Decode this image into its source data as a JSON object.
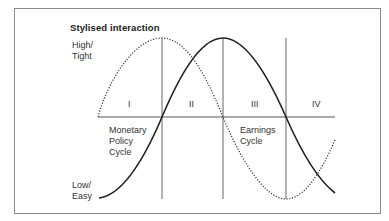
{
  "title": "Stylised interaction",
  "y_axis": {
    "top_label_line1": "High/",
    "top_label_line2": "Tight",
    "bottom_label_line1": "Low/",
    "bottom_label_line2": "Easy"
  },
  "phases": [
    "I",
    "II",
    "III",
    "IV"
  ],
  "curves": {
    "monetary": {
      "line1": "Monetary",
      "line2": "Policy",
      "line3": "Cycle",
      "style": "solid"
    },
    "earnings": {
      "line1": "Earnings",
      "line2": "Cycle",
      "style": "dotted"
    }
  },
  "colors": {
    "line": "#222222",
    "frame": "#8a8a8a",
    "grid": "#666666"
  }
}
